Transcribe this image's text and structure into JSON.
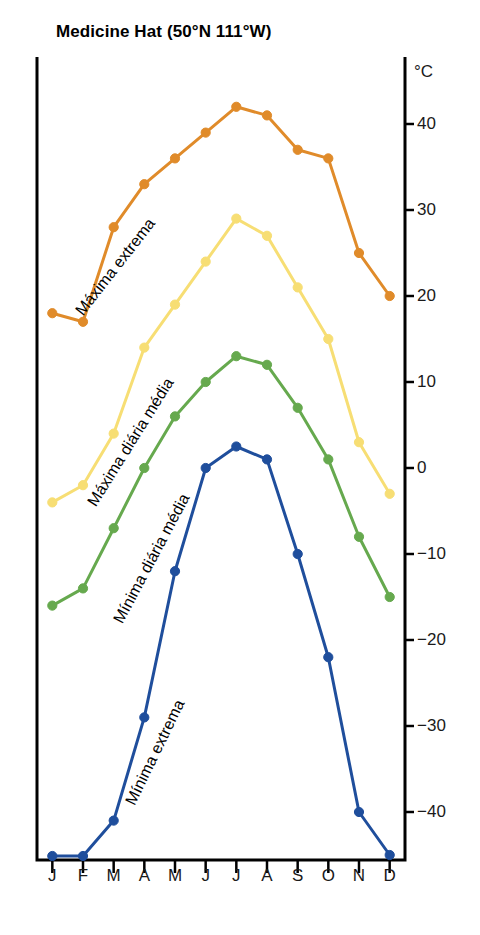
{
  "title": "Medicine Hat (50°N 111°W)",
  "axis": {
    "unit": "°C",
    "y_ticks": [
      40,
      30,
      20,
      10,
      0,
      -10,
      -20,
      -30,
      -40
    ],
    "y_tick_labels": [
      "40",
      "30",
      "20",
      "10",
      "0",
      "−10",
      "−20",
      "−30",
      "−40"
    ],
    "x_tick_labels": [
      "J",
      "F",
      "M",
      "A",
      "M",
      "J",
      "J",
      "A",
      "S",
      "O",
      "N",
      "D"
    ]
  },
  "series_labels": {
    "extreme_max": "Máxima extrema",
    "mean_max": "Máxima diária média",
    "mean_min": "Mínima diária média",
    "extreme_min": "Mínima extrema"
  },
  "colors": {
    "extreme_max": "#E08B2A",
    "mean_max": "#F7DE74",
    "mean_min": "#66A94E",
    "extreme_min": "#1F4E9C",
    "axis": "#000000"
  },
  "chart_data": {
    "type": "line",
    "title": "Medicine Hat (50°N 111°W)",
    "xlabel": "",
    "ylabel": "°C",
    "ylim": [
      -47,
      45
    ],
    "grid": false,
    "legend": "inline-labels",
    "categories": [
      "J",
      "F",
      "M",
      "A",
      "M",
      "J",
      "J",
      "A",
      "S",
      "O",
      "N",
      "D"
    ],
    "series": [
      {
        "name": "Máxima extrema",
        "color": "#E08B2A",
        "values": [
          18,
          17,
          28,
          33,
          36,
          39,
          42,
          41,
          37,
          36,
          25,
          20
        ]
      },
      {
        "name": "Máxima diária média",
        "color": "#F7DE74",
        "values": [
          -4,
          -2,
          4,
          14,
          19,
          24,
          29,
          27,
          21,
          15,
          3,
          -3
        ]
      },
      {
        "name": "Mínima diária média",
        "color": "#66A94E",
        "values": [
          -16,
          -14,
          -7,
          0,
          6,
          10,
          13,
          12,
          7,
          1,
          -8,
          -15
        ]
      },
      {
        "name": "Mínima extrema",
        "color": "#1F4E9C",
        "values": [
          -46,
          -46,
          -41,
          -29,
          -12,
          0,
          2.5,
          1,
          -10,
          -22,
          -40,
          -45
        ]
      }
    ]
  }
}
